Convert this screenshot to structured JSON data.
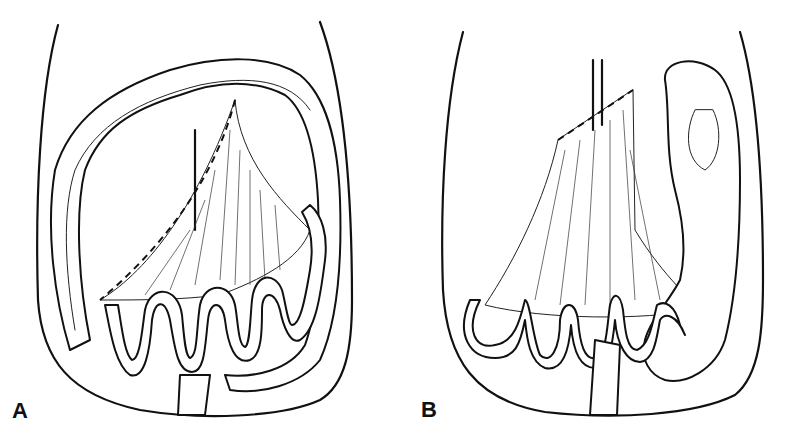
{
  "figure": {
    "panels": [
      {
        "label": "A",
        "description": "Abdomen outline with colon framing the mesentery; dashed incision line along mesenteric root; small bowel loops below"
      },
      {
        "label": "B",
        "description": "Mesentery fanned out with dashed cut edge at top; colon displaced to right side; small bowel loops along bottom"
      }
    ],
    "colors": {
      "ink": "#111111",
      "background": "#ffffff"
    }
  }
}
